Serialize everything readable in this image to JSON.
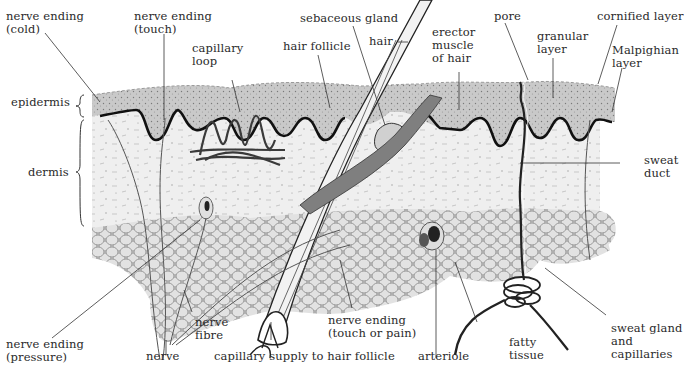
{
  "diagram": {
    "colors": {
      "background": "#ffffff",
      "epidermis": "#c9c9c9",
      "basal_line": "#111111",
      "dermis": "#efefef",
      "fat": "#d6d6d6",
      "fat_cell_stroke": "#8a8a8a",
      "muscle": "#7f7f7f",
      "ink": "#2a2a2a"
    },
    "layer_labels": {
      "epidermis": "epidermis",
      "dermis": "dermis"
    },
    "labels": [
      {
        "id": "nerve-ending-cold",
        "text": "nerve ending\n(cold)"
      },
      {
        "id": "nerve-ending-touch",
        "text": "nerve ending\n(touch)"
      },
      {
        "id": "capillary-loop",
        "text": "capillary\nloop"
      },
      {
        "id": "hair-follicle",
        "text": "hair follicle"
      },
      {
        "id": "sebaceous-gland",
        "text": "sebaceous gland"
      },
      {
        "id": "hair",
        "text": "hair"
      },
      {
        "id": "erector-muscle",
        "text": "erector\nmuscle\nof hair"
      },
      {
        "id": "pore",
        "text": "pore"
      },
      {
        "id": "granular-layer",
        "text": "granular\nlayer"
      },
      {
        "id": "cornified-layer",
        "text": "cornified layer"
      },
      {
        "id": "malpighian-layer",
        "text": "Malpighian\nlayer"
      },
      {
        "id": "sweat-duct",
        "text": "sweat\nduct"
      },
      {
        "id": "nerve-ending-pressure",
        "text": "nerve ending\n(pressure)"
      },
      {
        "id": "nerve-fibre",
        "text": "nerve\nfibre"
      },
      {
        "id": "nerve",
        "text": "nerve"
      },
      {
        "id": "capillary-supply",
        "text": "capillary supply to hair follicle"
      },
      {
        "id": "nerve-ending-touch-pain",
        "text": "nerve ending\n(touch or pain)"
      },
      {
        "id": "arteriole",
        "text": "arteriole"
      },
      {
        "id": "fatty-tissue",
        "text": "fatty\ntissue"
      },
      {
        "id": "sweat-gland",
        "text": "sweat gland\nand\ncapillaries"
      }
    ]
  }
}
